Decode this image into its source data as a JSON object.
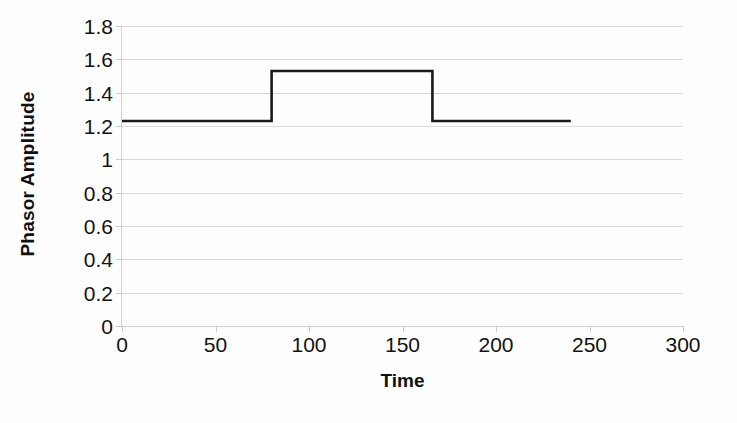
{
  "chart_data": {
    "type": "line",
    "title": "",
    "xlabel": "Time",
    "ylabel": "Phasor Amplitude",
    "xlim": [
      0,
      300
    ],
    "ylim": [
      0,
      1.8
    ],
    "grid": true,
    "legend": null,
    "legend_position": "none",
    "xticks": [
      0,
      50,
      100,
      150,
      200,
      250,
      300
    ],
    "xticklabels": [
      "0",
      "50",
      "100",
      "150",
      "200",
      "250",
      "300"
    ],
    "yticks": [
      0,
      0.2,
      0.4,
      0.6,
      0.8,
      1,
      1.2,
      1.4,
      1.6,
      1.8
    ],
    "yticklabels": [
      "0",
      "0.2",
      "0.4",
      "0.6",
      "0.8",
      "1",
      "1.2",
      "1.4",
      "1.6",
      "1.8"
    ],
    "series": [
      {
        "name": "Phasor Amplitude",
        "color": "#1b1b1b",
        "linewidth": 2.6,
        "x": [
          0,
          80,
          80,
          166,
          166,
          240
        ],
        "y": [
          1.23,
          1.23,
          1.53,
          1.53,
          1.23,
          1.23
        ]
      }
    ],
    "annotations": {
      "baseline_level": 1.23,
      "pulse_level": 1.53,
      "pulse_start_time": 80,
      "pulse_end_time": 166,
      "data_end_time": 240
    }
  },
  "style": {
    "background": "#ffffff",
    "gridline_color": "#d9d9d9",
    "axis_color": "#cfcfcf",
    "text_color": "#111111",
    "series_color": "#1b1b1b"
  }
}
